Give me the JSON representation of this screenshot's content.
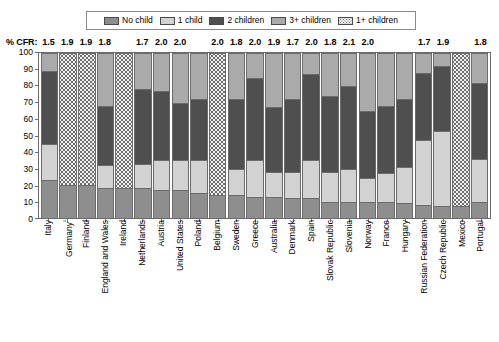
{
  "legend": {
    "items": [
      {
        "label": "No child",
        "key": "no_child",
        "pattern": "solid-medium-gray"
      },
      {
        "label": "1 child",
        "key": "one_child",
        "pattern": "solid-light-gray"
      },
      {
        "label": "2 children",
        "key": "two_children",
        "pattern": "solid-dark-gray"
      },
      {
        "label": "3+ children",
        "key": "three_plus",
        "pattern": "solid-gray"
      },
      {
        "label": "1+ children",
        "key": "one_plus",
        "pattern": "dotted"
      }
    ]
  },
  "cfr": {
    "title": "% CFR:",
    "values": [
      "1.5",
      "1.9",
      "1.9",
      "1.8",
      "1.7",
      "2.0",
      "2.0",
      "2.0",
      "1.8",
      "2.0",
      "1.9",
      "1.7",
      "2.0",
      "1.8",
      "2.1",
      "2.0",
      "1.7",
      "1.9",
      "1.8"
    ]
  },
  "colors": {
    "no_child": "#8e8e8e",
    "one_child": "#d2d2d2",
    "two_children": "#4f4f4f",
    "three_plus": "#aaaaaa",
    "one_plus_bg": "#f2f2f2",
    "one_plus_dots": "#6d6d6d",
    "axis": "#6b6b6b"
  },
  "yaxis": {
    "ticks": [
      "100",
      "90",
      "80",
      "70",
      "60",
      "50",
      "40",
      "30",
      "20",
      "10",
      "0"
    ],
    "min": 0,
    "max": 100
  },
  "chart_data": {
    "type": "bar",
    "subtype": "stacked-100-percent",
    "title": "",
    "xlabel": "",
    "ylabel": "",
    "ylim": [
      0,
      100
    ],
    "grid": false,
    "legend_position": "top",
    "series": [
      {
        "name": "No child",
        "key": "no_child"
      },
      {
        "name": "1 child",
        "key": "one_child"
      },
      {
        "name": "2 children",
        "key": "two_children"
      },
      {
        "name": "3+ children",
        "key": "three_plus"
      },
      {
        "name": "1+ children",
        "key": "one_plus"
      }
    ],
    "categories": [
      "Italy",
      "Germany",
      "Finland",
      "England and Wales",
      "Ireland",
      "Netherlands",
      "Austria",
      "United States",
      "Poland",
      "Belgium",
      "Sweden",
      "Greece",
      "Australia",
      "Denmark",
      "Spain",
      "Slovak Republic",
      "Slovenia",
      "Norway",
      "France",
      "Hungary",
      "Russian Federation",
      "Czech Republic",
      "Mexico",
      "Portugal"
    ],
    "category_labels": [
      "Italy",
      "Germany²",
      "Finland",
      "England and Wales",
      "Ireland",
      "Netherlands",
      "Austria",
      "United States",
      "Poland",
      "Belgium",
      "Sweden",
      "Greece",
      "Australia",
      "Denmark",
      "Spain",
      "Slovak Republic",
      "Slovenia",
      "Norway",
      "France",
      "Hungary",
      "Russian Federation",
      "Czech Republic",
      "Mexico",
      "Portugal"
    ],
    "cfr_by_category": [
      "1.5",
      "1.9",
      "1.9",
      "1.8",
      null,
      "1.7",
      "2.0",
      "2.0",
      null,
      "2.0",
      "1.8",
      "2.0",
      "1.9",
      "1.7",
      "2.0",
      "1.8",
      "2.1",
      "2.0",
      null,
      null,
      "1.7",
      "1.9",
      null,
      "1.8"
    ],
    "bars": [
      {
        "category": "Italy",
        "label": "Italy",
        "no_child": 23,
        "one_child": 22,
        "two_children": 44,
        "three_plus": 11,
        "one_plus": null
      },
      {
        "category": "Germany",
        "label": "Germany²",
        "no_child": 20,
        "one_child": null,
        "two_children": null,
        "three_plus": null,
        "one_plus": 80
      },
      {
        "category": "Finland",
        "label": "Finland",
        "no_child": 20,
        "one_child": null,
        "two_children": null,
        "three_plus": null,
        "one_plus": 80
      },
      {
        "category": "England and Wales",
        "label": "England and Wales",
        "no_child": 18,
        "one_child": 14,
        "two_children": 36,
        "three_plus": 32,
        "one_plus": null
      },
      {
        "category": "Ireland",
        "label": "Ireland",
        "no_child": 18,
        "one_child": null,
        "two_children": null,
        "three_plus": null,
        "one_plus": 82
      },
      {
        "category": "Netherlands",
        "label": "Netherlands",
        "no_child": 18,
        "one_child": 15,
        "two_children": 45,
        "three_plus": 22,
        "one_plus": null
      },
      {
        "category": "Austria",
        "label": "Austria",
        "no_child": 17,
        "one_child": 18,
        "two_children": 42,
        "three_plus": 23,
        "one_plus": null
      },
      {
        "category": "United States",
        "label": "United States",
        "no_child": 17,
        "one_child": 18,
        "two_children": 35,
        "three_plus": 30,
        "one_plus": null
      },
      {
        "category": "Poland",
        "label": "Poland",
        "no_child": 15,
        "one_child": 20,
        "two_children": 37,
        "three_plus": 28,
        "one_plus": null
      },
      {
        "category": "Belgium",
        "label": "Belgium",
        "no_child": 14,
        "one_child": null,
        "two_children": null,
        "three_plus": null,
        "one_plus": 86
      },
      {
        "category": "Sweden",
        "label": "Sweden",
        "no_child": 14,
        "one_child": 16,
        "two_children": 42,
        "three_plus": 28,
        "one_plus": null
      },
      {
        "category": "Greece",
        "label": "Greece",
        "no_child": 13,
        "one_child": 22,
        "two_children": 50,
        "three_plus": 15,
        "one_plus": null
      },
      {
        "category": "Australia",
        "label": "Australia",
        "no_child": 13,
        "one_child": 15,
        "two_children": 39,
        "three_plus": 33,
        "one_plus": null
      },
      {
        "category": "Denmark",
        "label": "Denmark",
        "no_child": 12,
        "one_child": 16,
        "two_children": 44,
        "three_plus": 28,
        "one_plus": null
      },
      {
        "category": "Spain",
        "label": "Spain",
        "no_child": 12,
        "one_child": 23,
        "two_children": 52,
        "three_plus": 13,
        "one_plus": null
      },
      {
        "category": "Slovak Republic",
        "label": "Slovak Republic",
        "no_child": 10,
        "one_child": 18,
        "two_children": 46,
        "three_plus": 26,
        "one_plus": null
      },
      {
        "category": "Slovenia",
        "label": "Slovenia",
        "no_child": 10,
        "one_child": 20,
        "two_children": 50,
        "three_plus": 20,
        "one_plus": null
      },
      {
        "category": "Norway",
        "label": "Norway",
        "no_child": 10,
        "one_child": 14,
        "two_children": 41,
        "three_plus": 35,
        "one_plus": null
      },
      {
        "category": "France",
        "label": "France",
        "no_child": 10,
        "one_child": 17,
        "two_children": 41,
        "three_plus": 32,
        "one_plus": null
      },
      {
        "category": "Hungary",
        "label": "Hungary",
        "no_child": 9,
        "one_child": 22,
        "two_children": 41,
        "three_plus": 28,
        "one_plus": null
      },
      {
        "category": "Russian Federation",
        "label": "Russian Federation",
        "no_child": 8,
        "one_child": 39,
        "two_children": 41,
        "three_plus": 12,
        "one_plus": null
      },
      {
        "category": "Czech Republic",
        "label": "Czech Republic",
        "no_child": 7,
        "one_child": 46,
        "two_children": 39,
        "three_plus": 8,
        "one_plus": null
      },
      {
        "category": "Mexico",
        "label": "Mexico",
        "no_child": 7,
        "one_child": null,
        "two_children": null,
        "three_plus": null,
        "one_plus": 93
      },
      {
        "category": "Portugal",
        "label": "Portugal",
        "no_child": 10,
        "one_child": 26,
        "two_children": 46,
        "three_plus": 18,
        "one_plus": null
      }
    ]
  }
}
